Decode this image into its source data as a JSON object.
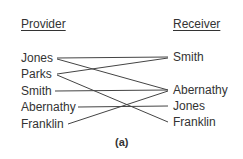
{
  "headers": {
    "provider": "Provider",
    "receiver": "Receiver"
  },
  "providers": [
    "Jones",
    "Parks",
    "Smith",
    "Abernathy",
    "Franklin"
  ],
  "receivers": [
    "Smith",
    "Abernathy",
    "Jones",
    "Franklin"
  ],
  "connections": [
    {
      "from": "Jones",
      "to": "Smith"
    },
    {
      "from": "Jones",
      "to": "Abernathy"
    },
    {
      "from": "Parks",
      "to": "Smith"
    },
    {
      "from": "Parks",
      "to": "Franklin"
    },
    {
      "from": "Smith",
      "to": "Abernathy"
    },
    {
      "from": "Abernathy",
      "to": "Jones"
    },
    {
      "from": "Franklin",
      "to": "Abernathy"
    }
  ],
  "caption": "(a)"
}
